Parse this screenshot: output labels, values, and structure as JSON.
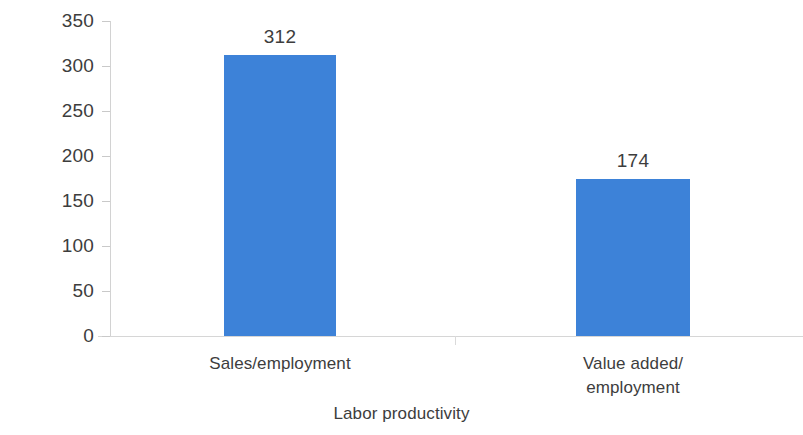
{
  "chart_data": {
    "type": "bar",
    "title": "",
    "subtitle": "",
    "xlabel": "Labor productivity",
    "ylabel": "Productivity premium (%)",
    "categories": [
      "Sales/employment",
      "Value added/\nemployment"
    ],
    "category_lines": [
      [
        "Sales/employment"
      ],
      [
        "Value added/",
        "employment"
      ]
    ],
    "values": [
      312,
      174
    ],
    "data_labels": [
      "312",
      "174"
    ],
    "ylim": [
      0,
      350
    ],
    "yticks": [
      0,
      50,
      100,
      150,
      200,
      250,
      300,
      350
    ],
    "ytick_labels": [
      "0",
      "50",
      "100",
      "150",
      "200",
      "250",
      "300",
      "350"
    ],
    "grid": false,
    "legend": null,
    "bar_color": "#3d82d8",
    "text_color": "#3d3d3d",
    "axis_color": "#d2d2d2"
  },
  "axes": {
    "y_title": "Productivity premium (%)",
    "x_title": "Labor productivity"
  }
}
